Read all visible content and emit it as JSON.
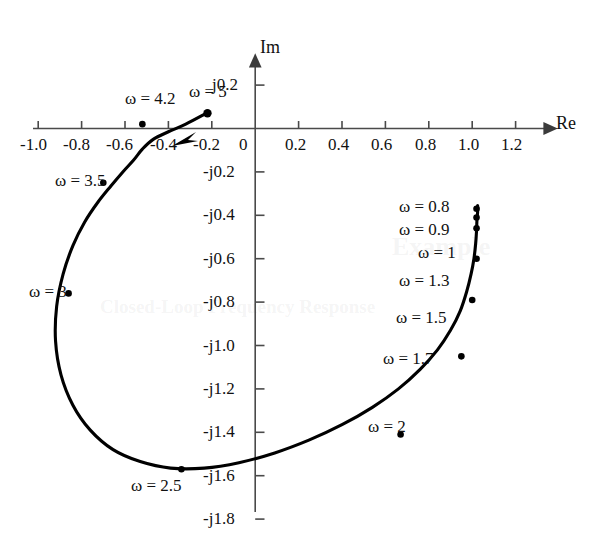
{
  "figure": {
    "kind": "nyquist-plot",
    "background_color": "#ffffff",
    "curve_color": "#000000",
    "axis_color": "#4a4a4a"
  },
  "axes": {
    "real": {
      "name": "Re",
      "tick_labels": [
        "-1.0",
        "-0.8",
        "-0.6",
        "-0.4",
        "-0.2",
        "0",
        "0.2",
        "0.4",
        "0.6",
        "0.8",
        "1.0",
        "1.2"
      ],
      "tick_values": [
        -1.0,
        -0.8,
        -0.6,
        -0.4,
        -0.2,
        0,
        0.2,
        0.4,
        0.6,
        0.8,
        1.0,
        1.2
      ],
      "range": [
        -1.12,
        1.32
      ]
    },
    "imag": {
      "name": "Im",
      "tick_labels": [
        "j0.2",
        "-j0.2",
        "-j0.4",
        "-j0.6",
        "-j0.8",
        "-j1.0",
        "-j1.2",
        "-j1.4",
        "-j1.6",
        "-j1.8"
      ],
      "tick_values": [
        0.2,
        -0.2,
        -0.4,
        -0.6,
        -0.8,
        -1.0,
        -1.2,
        -1.4,
        -1.6,
        -1.8
      ],
      "range": [
        0.28,
        -1.9
      ]
    },
    "origin_label": "0"
  },
  "annotations": [
    {
      "id": "w-0-8",
      "text": "ω = 0.8",
      "omega": 0.8,
      "re": 1.02,
      "im": -0.37
    },
    {
      "id": "w-0-9",
      "text": "ω = 0.9",
      "omega": 0.9,
      "re": 1.02,
      "im": -0.41
    },
    {
      "id": "w-1",
      "text": "ω = 1",
      "omega": 1.0,
      "re": 1.02,
      "im": -0.46
    },
    {
      "id": "w-1-3",
      "text": "ω = 1.3",
      "omega": 1.3,
      "re": 1.02,
      "im": -0.6
    },
    {
      "id": "w-1-5",
      "text": "ω = 1.5",
      "omega": 1.5,
      "re": 1.0,
      "im": -0.79
    },
    {
      "id": "w-1-7",
      "text": "ω = 1.7",
      "omega": 1.7,
      "re": 0.95,
      "im": -1.05
    },
    {
      "id": "w-2",
      "text": "ω = 2",
      "omega": 2.0,
      "re": 0.67,
      "im": -1.41
    },
    {
      "id": "w-2-5",
      "text": "ω = 2.5",
      "omega": 2.5,
      "re": -0.34,
      "im": -1.57
    },
    {
      "id": "w-3",
      "text": "ω = 3",
      "omega": 3.0,
      "re": -0.86,
      "im": -0.76
    },
    {
      "id": "w-3-5",
      "text": "ω = 3.5",
      "omega": 3.5,
      "re": -0.7,
      "im": -0.25
    },
    {
      "id": "w-4-2",
      "text": "ω = 4.2",
      "omega": 4.2,
      "re": -0.52,
      "im": 0.02
    },
    {
      "id": "w-5",
      "text": "ω = 5",
      "omega": 5.0,
      "re": -0.22,
      "im": 0.07
    }
  ],
  "chart_data": {
    "type": "scatter",
    "title": "",
    "xlabel": "Re",
    "ylabel": "Im",
    "xlim": [
      -1.12,
      1.32
    ],
    "ylim": [
      -1.9,
      0.28
    ],
    "grid": false,
    "legend": "none",
    "series": [
      {
        "name": "closed-loop frequency response",
        "marker": "dot",
        "line": "solid",
        "omega": [
          0.8,
          0.9,
          1.0,
          1.3,
          1.5,
          1.7,
          2.0,
          2.5,
          3.0,
          3.5,
          4.2,
          5.0
        ],
        "re": [
          1.02,
          1.02,
          1.02,
          1.02,
          1.0,
          0.95,
          0.67,
          -0.34,
          -0.86,
          -0.7,
          -0.52,
          -0.22
        ],
        "im": [
          -0.37,
          -0.41,
          -0.46,
          -0.6,
          -0.79,
          -1.05,
          -1.41,
          -1.57,
          -0.76,
          -0.25,
          0.02,
          0.07
        ]
      }
    ],
    "path_points_re": [
      1.025,
      1.025,
      1.022,
      1.02,
      1.016,
      1.008,
      0.995,
      0.975,
      0.945,
      0.9,
      0.84,
      0.76,
      0.66,
      0.54,
      0.4,
      0.25,
      0.09,
      -0.075,
      -0.235,
      -0.39,
      -0.53,
      -0.655,
      -0.76,
      -0.84,
      -0.895,
      -0.92,
      -0.915,
      -0.885,
      -0.84,
      -0.785,
      -0.725,
      -0.665,
      -0.61,
      -0.56,
      -0.52,
      -0.47,
      -0.4,
      -0.32,
      -0.225
    ],
    "path_points_im": [
      -0.355,
      -0.385,
      -0.42,
      -0.47,
      -0.53,
      -0.6,
      -0.67,
      -0.75,
      -0.84,
      -0.93,
      -1.02,
      -1.11,
      -1.2,
      -1.285,
      -1.365,
      -1.435,
      -1.495,
      -1.54,
      -1.565,
      -1.565,
      -1.535,
      -1.48,
      -1.39,
      -1.275,
      -1.135,
      -0.98,
      -0.82,
      -0.67,
      -0.54,
      -0.43,
      -0.34,
      -0.265,
      -0.2,
      -0.145,
      -0.095,
      -0.05,
      -0.015,
      0.02,
      0.07
    ]
  },
  "ghost_text": {
    "top_lines": [
      "",
      ""
    ],
    "mid_heading": "Example",
    "side_heading": "Closed-Loop Frequency Response",
    "body_lines": [
      "",
      "",
      "",
      ""
    ]
  }
}
